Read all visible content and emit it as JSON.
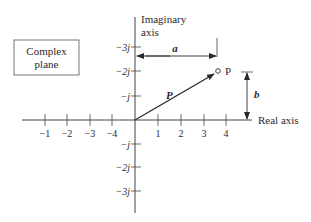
{
  "diagram": {
    "title_box": {
      "line1": "Complex",
      "line2": "plane"
    },
    "axes": {
      "imag_label_line1": "Imaginary",
      "imag_label_line2": "axis",
      "real_label": "Real axis"
    },
    "real_ticks_positive": [
      "1",
      "2",
      "3",
      "4"
    ],
    "real_ticks_negative": [
      "−1",
      "−2",
      "−3",
      "−4"
    ],
    "imag_ticks_upper": [
      "−3j",
      "−2j",
      "−j"
    ],
    "imag_ticks_lower": [
      "−j",
      "−2j",
      "−3j"
    ],
    "vector_label": "P",
    "point_label": "P",
    "horizontal_dim_label": "a",
    "vertical_dim_label": "b",
    "colors": {
      "ink": "#2a2a2a",
      "background": "#ffffff"
    }
  }
}
